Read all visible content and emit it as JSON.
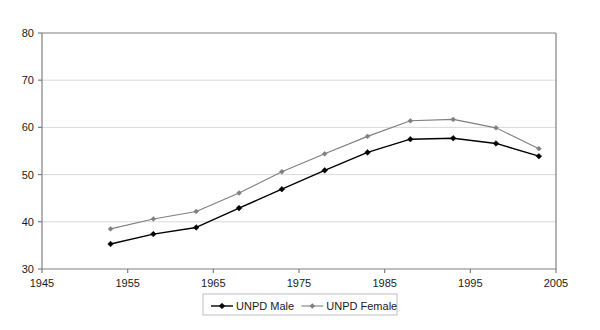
{
  "chart_data": {
    "type": "line",
    "title": "",
    "subtitle": "",
    "xlabel": "",
    "ylabel": "",
    "xlim": [
      1945,
      2005
    ],
    "ylim": [
      30,
      80
    ],
    "xticks": [
      1945,
      1955,
      1965,
      1975,
      1985,
      1995,
      2005
    ],
    "yticks": [
      30,
      40,
      50,
      60,
      70,
      80
    ],
    "grid": true,
    "grid_axis": "y",
    "legend_position": "bottom-center",
    "x": [
      1953,
      1958,
      1963,
      1968,
      1973,
      1978,
      1983,
      1988,
      1993,
      1998,
      2003
    ],
    "series": [
      {
        "name": "UNPD Male",
        "color": "#000000",
        "marker": "diamond",
        "values": [
          35.3,
          37.4,
          38.8,
          42.9,
          46.9,
          50.9,
          54.7,
          57.5,
          57.7,
          56.6,
          53.9
        ]
      },
      {
        "name": "UNPD Female",
        "color": "#7f7f7f",
        "marker": "diamond",
        "values": [
          38.5,
          40.6,
          42.2,
          46.1,
          50.6,
          54.4,
          58.1,
          61.4,
          61.7,
          59.9,
          55.5
        ]
      }
    ]
  },
  "axis": {
    "y_tick_labels": [
      "30",
      "40",
      "50",
      "60",
      "70",
      "80"
    ],
    "x_tick_labels": [
      "1945",
      "1955",
      "1965",
      "1975",
      "1985",
      "1995",
      "2005"
    ]
  },
  "legend": {
    "entries": [
      {
        "label": "UNPD Male",
        "color": "#000000"
      },
      {
        "label": "UNPD Female",
        "color": "#7f7f7f"
      }
    ]
  },
  "colors": {
    "plot_background": "#ffffff",
    "axis_line": "#808080",
    "gridline": "#d9d9d9",
    "male_series": "#000000",
    "female_series": "#7f7f7f",
    "legend_border": "#bfbfbf",
    "text": "#1a1a1a"
  }
}
